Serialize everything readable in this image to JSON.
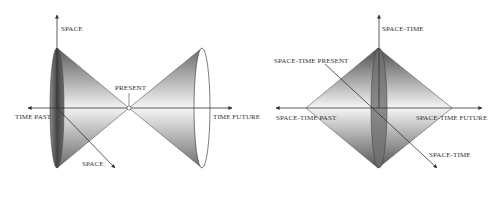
{
  "diagrams": {
    "left": {
      "title": "time light-cone",
      "labels": {
        "space_vertical": "SPACE",
        "present": "PRESENT",
        "time_past": "TIME PAST",
        "time_future": "TIME FUTURE",
        "space_diagonal": "SPACE"
      }
    },
    "right": {
      "title": "space-time diamond",
      "labels": {
        "space_time_vertical": "SPACE-TIME",
        "space_time_present": "SPACE-TIME PRESENT",
        "space_time_past": "SPACE-TIME PAST",
        "space_time_future": "SPACE-TIME FUTURE",
        "space_time_diagonal": "SPACE-TIME"
      }
    }
  },
  "colors": {
    "background": "#ffffff",
    "line": "#444444",
    "shade_dark": "#4a4a4a",
    "shade_mid": "#9a9a9a",
    "shade_light": "#f4f4f4",
    "text": "#333333"
  }
}
